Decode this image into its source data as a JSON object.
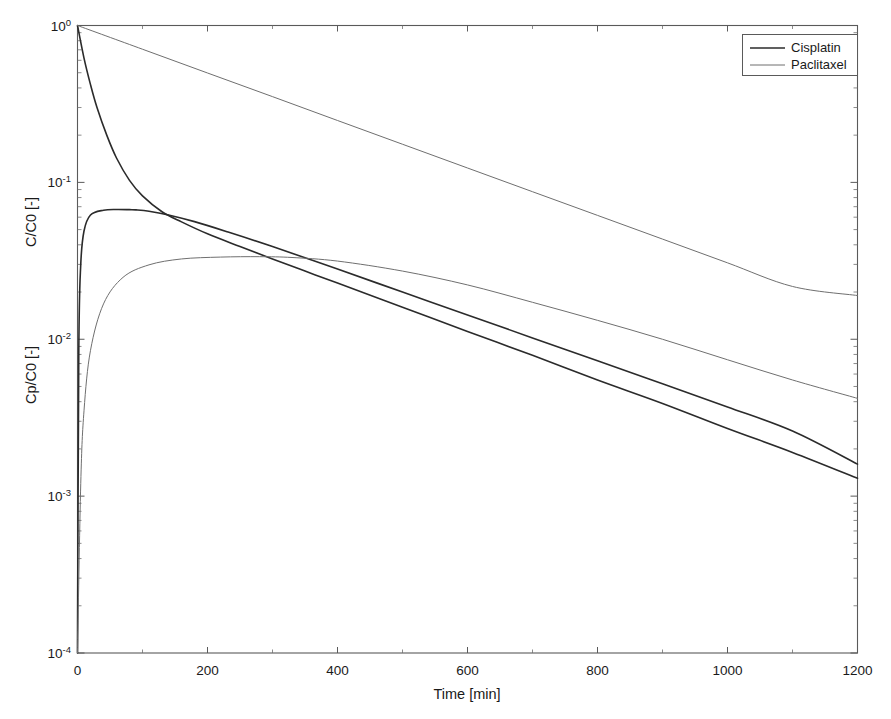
{
  "figure": {
    "background_color": "#ffffff",
    "frame_color": "#5a5a5a",
    "width": 891,
    "height": 719
  },
  "axes": {
    "x_title": "Time [min]",
    "y_title_inner": "C/C0 [-]",
    "y_title_outer": "Cp/C0 [-]",
    "x_ticks": [
      "0",
      "200",
      "400",
      "600",
      "800",
      "1000",
      "1200"
    ],
    "y_ticks": [
      "10",
      "10",
      "10",
      "10",
      "10"
    ],
    "y_tick_exponents": [
      "0",
      "-1",
      "-2",
      "-3",
      "-4"
    ]
  },
  "legend": {
    "position": "top-right",
    "entries": [
      {
        "label": "Cisplatin",
        "color": "#2b2b2b",
        "width": 1.6
      },
      {
        "label": "Paclitaxel",
        "color": "#6f6f6f",
        "width": 1.0
      }
    ]
  },
  "chart_data": {
    "type": "line",
    "title": "",
    "xlabel": "Time [min]",
    "ylabel": "Cp/C0 [-]   C/C0 [-]",
    "xlim": [
      0,
      1200
    ],
    "ylim": [
      0.0001,
      1
    ],
    "yscale": "log",
    "xscale": "linear",
    "grid": false,
    "legend_position": "upper right",
    "x_ticks": [
      0,
      200,
      400,
      600,
      800,
      1000,
      1200
    ],
    "y_ticks": [
      1,
      0.1,
      0.01,
      0.001,
      0.0001
    ],
    "series": [
      {
        "name": "Cisplatin plasma (Cp/C0)",
        "legend_label": "Cisplatin",
        "color": "#2b2b2b",
        "linewidth": 1.6,
        "comment": "biexponential plasma decay, steep alpha phase then slow beta phase",
        "x": [
          0,
          10,
          20,
          30,
          45,
          60,
          80,
          100,
          130,
          160,
          200,
          250,
          300,
          350,
          400,
          500,
          600,
          700,
          800,
          900,
          1000,
          1100,
          1200
        ],
        "y": [
          1.0,
          0.62,
          0.42,
          0.3,
          0.2,
          0.143,
          0.103,
          0.082,
          0.065,
          0.056,
          0.047,
          0.039,
          0.0325,
          0.0272,
          0.0228,
          0.016,
          0.0112,
          0.0079,
          0.0055,
          0.0039,
          0.0027,
          0.0019,
          0.0013
        ]
      },
      {
        "name": "Cisplatin tissue (C/C0)",
        "legend_label": "Cisplatin",
        "color": "#2b2b2b",
        "linewidth": 1.6,
        "comment": "rapid uptake to peak ~0.067 near t=90 min then terminal decay",
        "x": [
          0,
          2,
          5,
          10,
          20,
          40,
          60,
          80,
          90,
          110,
          140,
          180,
          230,
          300,
          400,
          500,
          600,
          700,
          800,
          900,
          1000,
          1100,
          1200
        ],
        "y": [
          0.0001,
          0.0085,
          0.03,
          0.049,
          0.062,
          0.0665,
          0.0672,
          0.067,
          0.0668,
          0.0655,
          0.062,
          0.0562,
          0.0485,
          0.039,
          0.028,
          0.02,
          0.0143,
          0.0102,
          0.0073,
          0.0052,
          0.0037,
          0.0026,
          0.0016
        ]
      },
      {
        "name": "Paclitaxel plasma (Cp/C0)",
        "legend_label": "Paclitaxel",
        "color": "#6f6f6f",
        "linewidth": 1.0,
        "comment": "near mono-exponential plasma decay, straight on log axis",
        "x": [
          0,
          100,
          200,
          300,
          400,
          500,
          600,
          700,
          800,
          900,
          1000,
          1100,
          1200
        ],
        "y": [
          1.0,
          0.706,
          0.498,
          0.352,
          0.248,
          0.175,
          0.1235,
          0.0872,
          0.0616,
          0.0435,
          0.0307,
          0.0217,
          0.019
        ]
      },
      {
        "name": "Paclitaxel tissue (C/C0)",
        "legend_label": "Paclitaxel",
        "color": "#6f6f6f",
        "linewidth": 1.0,
        "comment": "slower uptake to plateau ~0.033 near t=300 min then terminal decay",
        "x": [
          0,
          5,
          10,
          20,
          40,
          70,
          110,
          160,
          220,
          280,
          330,
          400,
          500,
          600,
          700,
          800,
          900,
          1000,
          1100,
          1200
        ],
        "y": [
          0.0001,
          0.0012,
          0.0035,
          0.0085,
          0.0168,
          0.0248,
          0.0298,
          0.0325,
          0.0334,
          0.0336,
          0.0332,
          0.0315,
          0.0272,
          0.0222,
          0.0172,
          0.0132,
          0.01,
          0.0074,
          0.0055,
          0.0042
        ]
      }
    ]
  }
}
